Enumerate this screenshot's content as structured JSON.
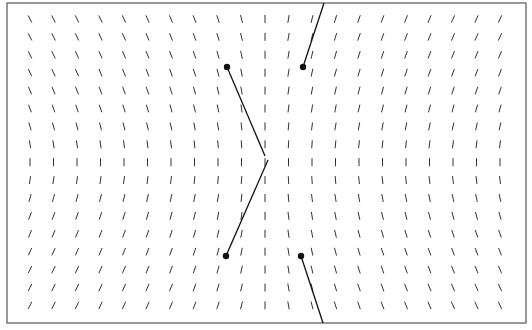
{
  "figure": {
    "type": "direction_field_with_trajectories",
    "frame": {
      "x": 7,
      "y": 3,
      "width": 519,
      "height": 320,
      "stroke": "#555555"
    },
    "grid": {
      "x_start": 30,
      "x_step": 23.5,
      "cols": 21,
      "y_start": 19,
      "y_step": 17.9,
      "rows": 17,
      "center_col": 10,
      "center_row": 8,
      "dash_length": 8,
      "dash_color": "#333333"
    },
    "angles_deg": [
      [
        -27,
        -27,
        -26,
        -26,
        -25,
        -24,
        -23,
        -21,
        -18,
        -14,
        0,
        10,
        14,
        17,
        19,
        21,
        22,
        23,
        24,
        24,
        25
      ],
      [
        -27,
        -26,
        -26,
        -25,
        -24,
        -23,
        -22,
        -20,
        -17,
        -13,
        0,
        10,
        14,
        17,
        19,
        20,
        21,
        22,
        23,
        24,
        24
      ],
      [
        -26,
        -26,
        -25,
        -24,
        -23,
        -22,
        -21,
        -19,
        -16,
        -12,
        0,
        9,
        13,
        16,
        18,
        19,
        20,
        21,
        22,
        22,
        23
      ],
      [
        -25,
        -25,
        -24,
        -23,
        -22,
        -21,
        -20,
        -18,
        -15,
        -11,
        0,
        9,
        12,
        15,
        17,
        18,
        19,
        20,
        20,
        21,
        21
      ],
      [
        -23,
        -23,
        -22,
        -21,
        -20,
        -19,
        -18,
        -16,
        -13,
        -10,
        0,
        8,
        11,
        13,
        15,
        16,
        17,
        18,
        18,
        19,
        19
      ],
      [
        -20,
        -20,
        -19,
        -19,
        -18,
        -17,
        -15,
        -14,
        -11,
        -8,
        0,
        7,
        9,
        11,
        13,
        14,
        14,
        15,
        15,
        16,
        16
      ],
      [
        -16,
        -16,
        -15,
        -15,
        -14,
        -13,
        -12,
        -11,
        -9,
        -6,
        0,
        5,
        7,
        9,
        10,
        11,
        11,
        12,
        12,
        12,
        13
      ],
      [
        -9,
        -9,
        -9,
        -8,
        -8,
        -7,
        -7,
        -6,
        -5,
        -4,
        0,
        3,
        4,
        5,
        6,
        6,
        6,
        7,
        7,
        7,
        7
      ],
      [
        0,
        0,
        0,
        0,
        0,
        0,
        0,
        0,
        0,
        0,
        0,
        0,
        0,
        0,
        0,
        0,
        0,
        0,
        0,
        0,
        0
      ],
      [
        9,
        9,
        9,
        8,
        8,
        7,
        7,
        6,
        5,
        4,
        0,
        -3,
        -4,
        -5,
        -6,
        -6,
        -6,
        -7,
        -7,
        -7,
        -7
      ],
      [
        16,
        16,
        15,
        15,
        14,
        13,
        12,
        11,
        9,
        6,
        0,
        -5,
        -7,
        -9,
        -10,
        -11,
        -11,
        -12,
        -12,
        -12,
        -13
      ],
      [
        20,
        20,
        19,
        19,
        18,
        17,
        15,
        14,
        11,
        8,
        0,
        -7,
        -9,
        -11,
        -13,
        -14,
        -14,
        -15,
        -15,
        -16,
        -16
      ],
      [
        23,
        23,
        22,
        21,
        20,
        19,
        18,
        16,
        13,
        10,
        0,
        -8,
        -11,
        -13,
        -15,
        -16,
        -17,
        -18,
        -18,
        -19,
        -19
      ],
      [
        25,
        25,
        24,
        23,
        22,
        21,
        20,
        18,
        15,
        11,
        0,
        -9,
        -12,
        -15,
        -17,
        -18,
        -19,
        -20,
        -20,
        -21,
        -21
      ],
      [
        26,
        26,
        25,
        24,
        23,
        22,
        21,
        19,
        16,
        12,
        0,
        -9,
        -13,
        -16,
        -18,
        -19,
        -20,
        -21,
        -22,
        -22,
        -23
      ],
      [
        27,
        26,
        26,
        25,
        24,
        23,
        22,
        20,
        17,
        13,
        0,
        -10,
        -14,
        -17,
        -19,
        -20,
        -21,
        -22,
        -23,
        -24,
        -24
      ],
      [
        27,
        27,
        26,
        26,
        25,
        24,
        23,
        21,
        18,
        14,
        0,
        -10,
        -14,
        -17,
        -19,
        -21,
        -22,
        -23,
        -24,
        -24,
        -25
      ]
    ],
    "trajectories": [
      {
        "name": "trajectory-upper-left",
        "start": [
          227,
          67
        ],
        "end": [
          265,
          156
        ]
      },
      {
        "name": "trajectory-lower-left",
        "start": [
          226,
          256
        ],
        "end": [
          268,
          160
        ]
      },
      {
        "name": "trajectory-upper-right",
        "start": [
          303,
          67
        ],
        "end": [
          324,
          3
        ]
      },
      {
        "name": "trajectory-lower-right",
        "start": [
          301,
          256
        ],
        "end": [
          323,
          323
        ]
      }
    ],
    "trajectory_style": {
      "stroke": "#111111",
      "width": 1.3,
      "dot_radius": 3.2
    }
  }
}
